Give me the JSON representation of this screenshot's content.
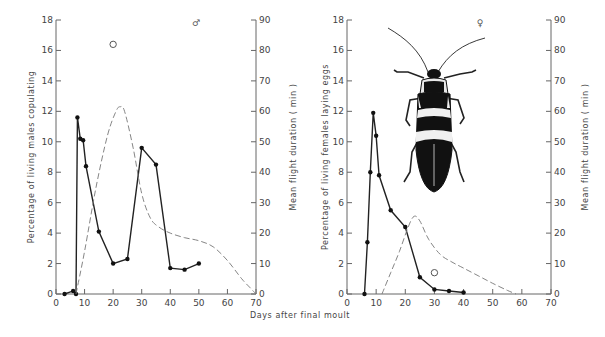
{
  "figure": {
    "xlabel": "Days after final moult"
  },
  "chart_data": [
    {
      "type": "line",
      "panel": "left",
      "sex_symbol": "♂",
      "ylabel_left": "Percentage of living males copulating",
      "ylabel_right": "Mean flight duration ( min )",
      "xlabel": "Days after final moult",
      "xlim": [
        0,
        70
      ],
      "xticks": [
        0,
        10,
        20,
        30,
        40,
        50,
        60,
        70
      ],
      "ylim_left": [
        0,
        18
      ],
      "yticks_left": [
        0,
        2,
        4,
        6,
        8,
        10,
        12,
        14,
        16,
        18
      ],
      "ylim_right": [
        0,
        90
      ],
      "yticks_right": [
        0,
        10,
        20,
        30,
        40,
        50,
        60,
        70,
        80,
        90
      ],
      "grid": false,
      "series": [
        {
          "name": "Percentage of living males copulating",
          "style": "solid line with filled circles",
          "axis": "left",
          "x": [
            3,
            6,
            7,
            7.5,
            8.5,
            9.5,
            10.5,
            15,
            20,
            25,
            30,
            35,
            40,
            45,
            50
          ],
          "y": [
            0,
            0.2,
            0,
            11.6,
            10.2,
            10.1,
            8.4,
            4.1,
            2.0,
            2.3,
            9.6,
            8.5,
            1.7,
            1.6,
            2.0
          ]
        },
        {
          "name": "Mean flight duration",
          "style": "dashed curve",
          "axis": "right",
          "x": [
            7,
            10,
            14,
            18,
            21,
            22.5,
            24,
            27,
            30,
            33,
            36,
            40,
            45,
            50,
            55,
            60,
            65,
            68,
            70
          ],
          "y": [
            0,
            14,
            35,
            52,
            60,
            61.5,
            60,
            48,
            33,
            25,
            22,
            20,
            18.5,
            17.5,
            15.5,
            11,
            5,
            2,
            0
          ]
        },
        {
          "name": "Open circle point",
          "style": "open circle",
          "axis": "left",
          "x": [
            20
          ],
          "y": [
            16.4
          ]
        }
      ]
    },
    {
      "type": "line",
      "panel": "right",
      "sex_symbol": "♀",
      "ylabel_left": "Percentage of living females laying eggs",
      "ylabel_right": "Mean flight duration ( min )",
      "xlabel": "Days after final moult",
      "xlim": [
        0,
        70
      ],
      "xticks": [
        0,
        10,
        20,
        30,
        40,
        50,
        60,
        70
      ],
      "ylim_left": [
        0,
        18
      ],
      "yticks_left": [
        0,
        2,
        4,
        6,
        8,
        10,
        12,
        14,
        16,
        18
      ],
      "ylim_right": [
        0,
        90
      ],
      "yticks_right": [
        0,
        10,
        20,
        30,
        40,
        50,
        60,
        70,
        80,
        90
      ],
      "grid": false,
      "series": [
        {
          "name": "Percentage of living females laying eggs",
          "style": "solid line with filled circles",
          "axis": "left",
          "x": [
            6,
            7,
            8,
            9,
            10,
            11,
            15,
            20,
            25,
            30,
            35,
            40
          ],
          "y": [
            0,
            3.4,
            8.0,
            11.9,
            10.4,
            7.8,
            5.5,
            4.4,
            1.1,
            0.3,
            0.2,
            0.1
          ]
        },
        {
          "name": "Mean flight duration",
          "style": "dashed curve",
          "axis": "right",
          "x": [
            12,
            15,
            18,
            21,
            23,
            25,
            28,
            32,
            36,
            40,
            45,
            50,
            55,
            58
          ],
          "y": [
            0,
            7,
            14,
            22,
            25.5,
            24,
            18,
            13,
            10.5,
            8.5,
            6,
            3.5,
            1.2,
            0
          ]
        },
        {
          "name": "Open circle point",
          "style": "open circle",
          "axis": "left",
          "x": [
            30
          ],
          "y": [
            1.4
          ]
        }
      ]
    }
  ]
}
